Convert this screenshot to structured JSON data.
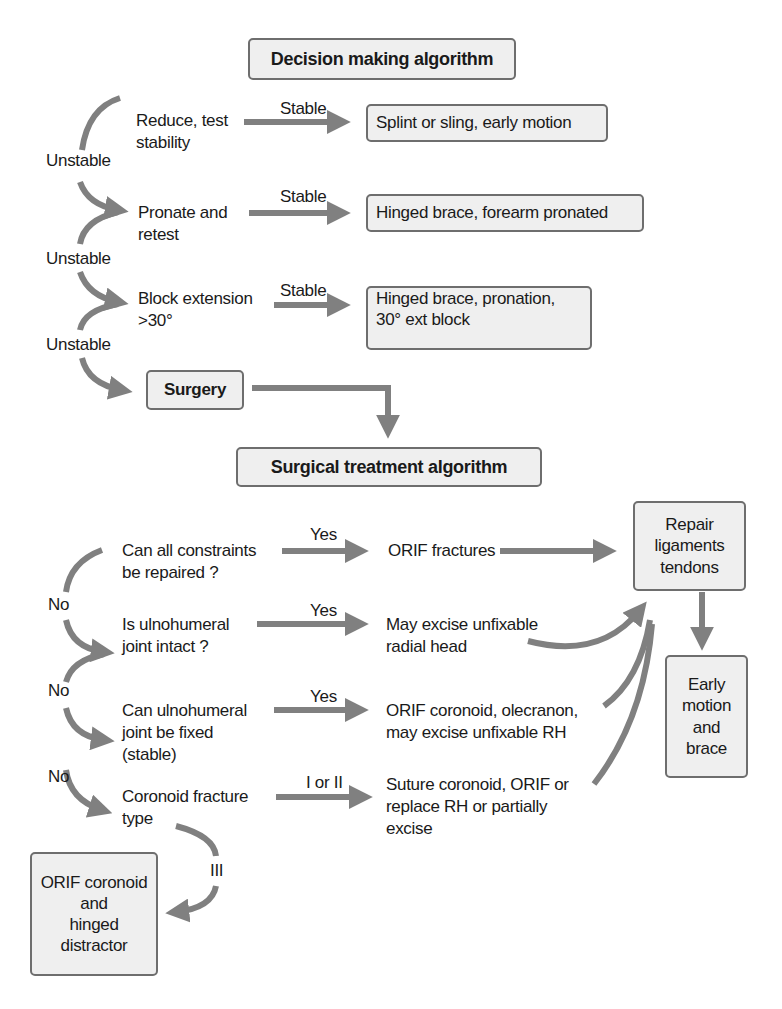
{
  "decision": {
    "title": "Decision making algorithm",
    "steps": [
      {
        "label_line1": "Reduce, test",
        "label_line2": "stability",
        "edge": "Stable",
        "result": "Splint or sling, early motion"
      },
      {
        "label_line1": "Pronate and",
        "label_line2": "retest",
        "edge": "Stable",
        "result": "Hinged brace, forearm pronated"
      },
      {
        "label_line1": "Block extension",
        "label_line2": ">30°",
        "edge": "Stable",
        "result_line1": "Hinged brace, pronation,",
        "result_line2": "30° ext block"
      }
    ],
    "unstable_labels": [
      "Unstable",
      "Unstable",
      "Unstable"
    ],
    "surgery": "Surgery"
  },
  "surgical": {
    "title": "Surgical treatment algorithm",
    "questions": [
      {
        "line1": "Can all constraints",
        "line2": "be repaired ?",
        "edge": "Yes",
        "result_line1": "ORIF fractures"
      },
      {
        "line1": "Is ulnohumeral",
        "line2": "joint intact ?",
        "edge": "Yes",
        "result_line1": "May excise unfixable",
        "result_line2": "radial head"
      },
      {
        "line1": "Can ulnohumeral",
        "line2": "joint be fixed",
        "line3": "(stable)",
        "edge": "Yes",
        "result_line1": "ORIF coronoid, olecranon,",
        "result_line2": "may excise unfixable RH"
      },
      {
        "line1": "Coronoid fracture",
        "line2": "type",
        "edge": "I or II",
        "result_line1": "Suture coronoid, ORIF or",
        "result_line2": "replace RH or partially",
        "result_line3": "excise"
      }
    ],
    "no_labels": [
      "No",
      "No",
      "No"
    ],
    "type3_label": "III",
    "type3_result": [
      "ORIF coronoid",
      "and",
      "hinged",
      "distractor"
    ],
    "repair": [
      "Repair",
      "ligaments",
      "tendons"
    ],
    "final": [
      "Early",
      "motion",
      "and",
      "brace"
    ]
  },
  "colors": {
    "arrow": "#808080",
    "box_fill": "#efefef",
    "box_border": "#6e6e6e"
  }
}
